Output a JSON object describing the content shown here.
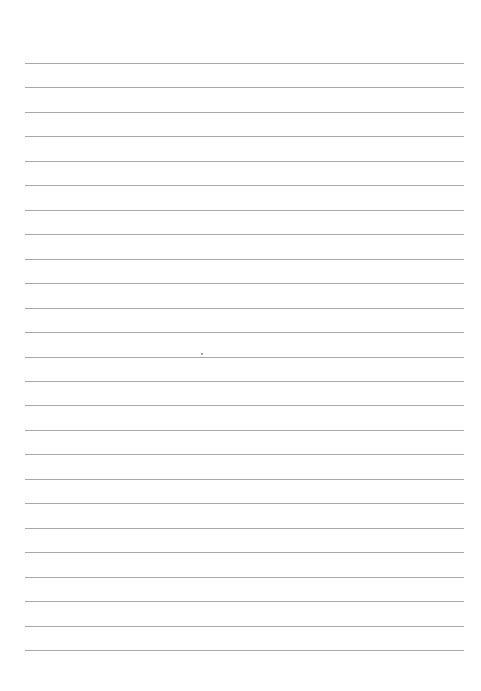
{
  "page": {
    "type": "lined-paper",
    "background": "#ffffff",
    "rule_color": "#a8a8a8",
    "rule_count": 25,
    "first_rule_y": 63,
    "rule_spacing": 24.46,
    "rule_left": 25,
    "rule_width": 439
  }
}
